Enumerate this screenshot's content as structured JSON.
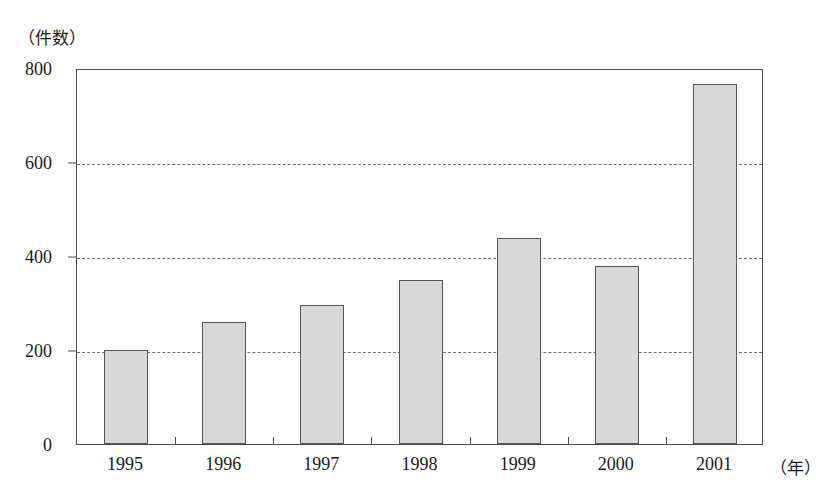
{
  "chart_data": {
    "type": "bar",
    "title": "",
    "subtitle": "",
    "xlabel": "（年）",
    "ylabel": "（件数）",
    "categories": [
      "1995",
      "1996",
      "1997",
      "1998",
      "1999",
      "2000",
      "2001"
    ],
    "values": [
      200,
      260,
      295,
      350,
      438,
      378,
      765
    ],
    "series": [
      {
        "name": "件数",
        "values": [
          200,
          260,
          295,
          350,
          438,
          378,
          765
        ]
      }
    ],
    "ylim": [
      0,
      800
    ],
    "y_ticks": [
      0,
      200,
      400,
      600,
      800
    ],
    "y_tick_labels": [
      "0",
      "200",
      "400",
      "600",
      "800"
    ],
    "grid": "horizontal-dashed",
    "gridlines_at": [
      200,
      400,
      600
    ],
    "legend": "none",
    "bar_fill_color": "#d8d8d8",
    "bar_border_color": "#555555",
    "axis_color": "#4a4a4a",
    "grid_color": "#6f6f6f",
    "background_color": "#ffffff"
  }
}
